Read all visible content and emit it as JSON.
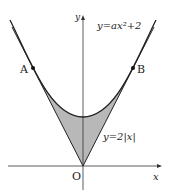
{
  "figure": {
    "type": "coordinate-graph",
    "axes": {
      "x_label": "x",
      "y_label": "y",
      "origin_label": "O"
    },
    "curves": [
      {
        "name": "parabola",
        "equation_label": "y=ax²+2"
      },
      {
        "name": "absolute-value",
        "equation_label": "y=2|x|"
      }
    ],
    "points": [
      {
        "label": "A"
      },
      {
        "label": "B"
      }
    ],
    "shaded_region": "region between y=2|x| and y=ax²+2 from A to B",
    "colors": {
      "line": "#222222",
      "shade": "#b8b8b8"
    }
  }
}
